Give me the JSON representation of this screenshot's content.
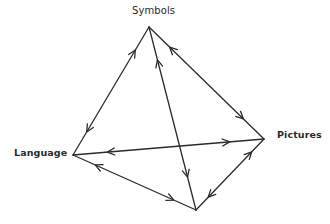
{
  "diagram": {
    "type": "bidirectional-tetrahedron",
    "nodes": [
      {
        "id": "symbols",
        "label": "Symbols",
        "x": 149,
        "y": 27
      },
      {
        "id": "language",
        "label": "Language",
        "x": 73,
        "y": 155
      },
      {
        "id": "pictures",
        "label": "Pictures",
        "x": 264,
        "y": 139
      },
      {
        "id": "bottom",
        "label": "",
        "x": 196,
        "y": 210
      }
    ],
    "edges": [
      {
        "from": "symbols",
        "to": "language",
        "bidirectional": true
      },
      {
        "from": "symbols",
        "to": "pictures",
        "bidirectional": true
      },
      {
        "from": "symbols",
        "to": "bottom",
        "bidirectional": true
      },
      {
        "from": "language",
        "to": "pictures",
        "bidirectional": true
      },
      {
        "from": "language",
        "to": "bottom",
        "bidirectional": true
      },
      {
        "from": "pictures",
        "to": "bottom",
        "bidirectional": true
      }
    ],
    "colors": {
      "line": "#2b2b2b",
      "label": "#2a2a2a",
      "background": "#ffffff"
    }
  }
}
